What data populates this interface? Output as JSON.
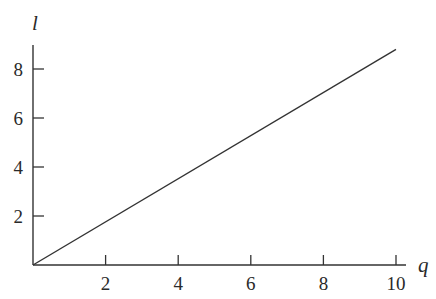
{
  "chart_data": {
    "type": "line",
    "title": "",
    "xlabel": "q",
    "ylabel": "l",
    "xlim": [
      0,
      10.3
    ],
    "ylim": [
      0,
      9
    ],
    "xticks": [
      2,
      4,
      6,
      8,
      10
    ],
    "yticks": [
      2,
      4,
      6,
      8
    ],
    "xtick_labels": [
      "2",
      "4",
      "6",
      "8",
      "10"
    ],
    "ytick_labels": [
      "2",
      "4",
      "6",
      "8"
    ],
    "grid": false,
    "legend": null,
    "series": [
      {
        "name": "l vs q",
        "x": [
          0,
          10
        ],
        "y": [
          0,
          8.8
        ]
      }
    ]
  },
  "colors": {
    "axis": "#333333",
    "line": "#333333",
    "text": "#2a2a2a",
    "background": "#ffffff"
  }
}
